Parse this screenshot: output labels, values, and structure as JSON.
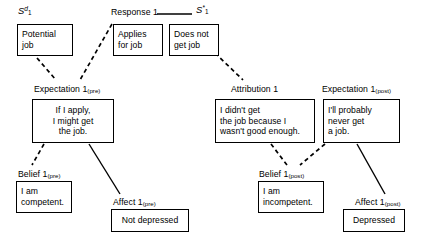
{
  "diagram": {
    "line_color": "#000000",
    "box_border_color": "#000000",
    "background": "#ffffff",
    "labels": [
      {
        "id": "stimulus-discriminative",
        "text_html": "S",
        "sup": "d",
        "sub": "1",
        "italic": true,
        "x": 18,
        "y": 6
      },
      {
        "id": "response-1",
        "text": "Response 1",
        "x": 111,
        "y": 7
      },
      {
        "id": "stimulus-star",
        "text_html": "S",
        "sup": "*",
        "sub": "1",
        "italic": true,
        "x": 196,
        "y": 5
      },
      {
        "id": "expectation-1-pre",
        "text": "Expectation 1",
        "sub": "(pre)",
        "x": 34,
        "y": 84
      },
      {
        "id": "attribution-1",
        "text": "Attribution 1",
        "sub": "",
        "x": 231,
        "y": 84
      },
      {
        "id": "expectation-1-post",
        "text": "Expectation 1",
        "sub": "(post)",
        "x": 322,
        "y": 84
      },
      {
        "id": "belief-1-pre",
        "text": "Belief 1",
        "sub": "(pre)",
        "x": 18,
        "y": 169
      },
      {
        "id": "affect-1-pre",
        "text": "Affect 1",
        "sub": "(pre)",
        "x": 113,
        "y": 197
      },
      {
        "id": "belief-1-post",
        "text": "Belief 1",
        "sub": "(post)",
        "x": 259,
        "y": 169
      },
      {
        "id": "affect-1-post",
        "text": "Affect 1",
        "sub": "(post)",
        "x": 355,
        "y": 197
      }
    ],
    "boxes": [
      {
        "id": "potential-job",
        "text": "Potential\njob",
        "align": "left",
        "x": 17,
        "y": 24,
        "w": 56,
        "h": 32
      },
      {
        "id": "applies-for-job",
        "text": "Applies\nfor job",
        "align": "left",
        "x": 113,
        "y": 24,
        "w": 50,
        "h": 32
      },
      {
        "id": "does-not-get-job",
        "text": "Does not\nget job",
        "align": "left",
        "x": 169,
        "y": 24,
        "w": 50,
        "h": 32
      },
      {
        "id": "if-i-apply",
        "text": "If I apply,\nI might get\nthe job.",
        "align": "center",
        "x": 32,
        "y": 99,
        "w": 82,
        "h": 44
      },
      {
        "id": "i-didnt-get-the-job",
        "text": "I didn't get\nthe job because I\nwasn't good enough.",
        "align": "left",
        "x": 215,
        "y": 99,
        "w": 100,
        "h": 44
      },
      {
        "id": "ill-probably-never",
        "text": "I'll probably\nnever get\na job.",
        "align": "left",
        "x": 323,
        "y": 99,
        "w": 77,
        "h": 44
      },
      {
        "id": "i-am-competent",
        "text": "I am\ncompetent.",
        "align": "left",
        "x": 16,
        "y": 181,
        "w": 56,
        "h": 32
      },
      {
        "id": "not-depressed",
        "text": "Not depressed",
        "align": "center",
        "x": 111,
        "y": 209,
        "w": 78,
        "h": 23
      },
      {
        "id": "i-am-incompetent",
        "text": "I am\nincompetent.",
        "align": "left",
        "x": 258,
        "y": 181,
        "w": 66,
        "h": 32
      },
      {
        "id": "depressed",
        "text": "Depressed",
        "align": "center",
        "x": 343,
        "y": 209,
        "w": 62,
        "h": 23
      }
    ],
    "connectors": [
      {
        "id": "response-to-stimulus-star",
        "style": "solid",
        "from": "response-1",
        "to": "stimulus-star",
        "x1": 157,
        "y1": 14,
        "x2": 192,
        "y2": 14
      },
      {
        "id": "potential-job-to-expectation-pre",
        "style": "dashed",
        "from": "potential-job",
        "to": "expectation-1-pre",
        "x1": 37,
        "y1": 58,
        "x2": 56,
        "y2": 80
      },
      {
        "id": "response-to-expectation-pre",
        "style": "dashed",
        "from": "response-1",
        "to": "expectation-1-pre",
        "x1": 112,
        "y1": 24,
        "x2": 80,
        "y2": 80
      },
      {
        "id": "does-not-get-job-to-attribution",
        "style": "dashed",
        "from": "does-not-get-job",
        "to": "attribution-1",
        "x1": 215,
        "y1": 53,
        "x2": 243,
        "y2": 80
      },
      {
        "id": "expectation-pre-to-belief-pre",
        "style": "dashed",
        "from": "if-i-apply",
        "to": "belief-1-pre",
        "x1": 44,
        "y1": 144,
        "x2": 32,
        "y2": 165
      },
      {
        "id": "expectation-pre-to-affect-pre",
        "style": "solid",
        "from": "if-i-apply",
        "to": "affect-1-pre",
        "x1": 89,
        "y1": 144,
        "x2": 120,
        "y2": 194
      },
      {
        "id": "attribution-to-belief-post",
        "style": "dashed",
        "from": "i-didnt-get-the-job",
        "to": "belief-1-post",
        "x1": 271,
        "y1": 144,
        "x2": 287,
        "y2": 165
      },
      {
        "id": "expectation-post-to-belief-post",
        "style": "dashed",
        "from": "ill-probably-never",
        "to": "belief-1-post",
        "x1": 325,
        "y1": 144,
        "x2": 300,
        "y2": 165
      },
      {
        "id": "expectation-post-to-affect-post",
        "style": "solid",
        "from": "ill-probably-never",
        "to": "affect-1-post",
        "x1": 357,
        "y1": 144,
        "x2": 385,
        "y2": 194
      }
    ]
  }
}
